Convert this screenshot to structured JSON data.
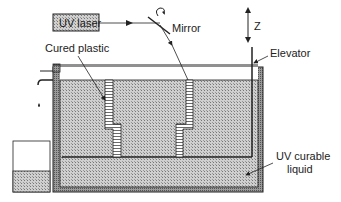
{
  "diagram": {
    "labels": {
      "uv_laser": "UV laser",
      "mirror": "Mirror",
      "z_axis": "Z",
      "cured_plastic": "Cured plastic",
      "elevator": "Elevator",
      "uv_liquid_line1": "UV curable",
      "uv_liquid_line2": "liquid"
    },
    "colors": {
      "line": "#222222",
      "liquid": "#b8b8b8",
      "wall": "#8a8a8a",
      "laser_box": "#bdbdbd"
    }
  }
}
